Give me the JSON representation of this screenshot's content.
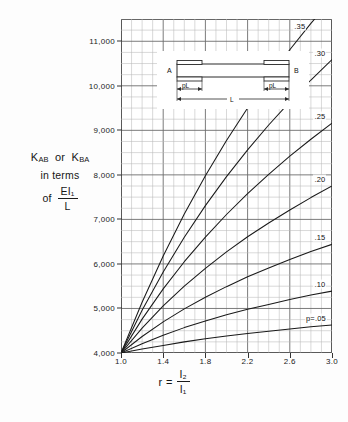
{
  "figure": {
    "y_axis_title": {
      "line1_k1": "K",
      "line1_k1_sub": "AB",
      "line1_or": "or",
      "line1_k2": "K",
      "line1_k2_sub": "BA",
      "line2": "in terms",
      "line3_of": "of",
      "line3_num": "EI₁",
      "line3_den": "L"
    },
    "x_axis_title": {
      "symbol": "r",
      "equals": "=",
      "num": "I₂",
      "den": "I₁"
    },
    "beam_diagram": {
      "left_support_label": "A",
      "right_support_label": "B",
      "left_dim_label": "pL",
      "right_dim_label": "pL",
      "span_label": "L"
    }
  },
  "chart_data": {
    "type": "line",
    "title": "",
    "xlabel": "r = I2/I1",
    "ylabel": "KAB or KBA in terms of EI1/L",
    "xlim": [
      1.0,
      3.0
    ],
    "ylim": [
      4000,
      11500
    ],
    "xticks": [
      1.0,
      1.4,
      1.8,
      2.2,
      2.6,
      3.0
    ],
    "xtick_labels": [
      "1.0",
      "1.4",
      "1.8",
      "2.2",
      "2.6",
      "3.0"
    ],
    "yticks": [
      4000,
      5000,
      6000,
      7000,
      8000,
      9000,
      10000,
      11000
    ],
    "ytick_labels": [
      "4,000",
      "5,000",
      "6,000",
      "7,000",
      "8,000",
      "9,000",
      "10,000",
      "11,000"
    ],
    "grid": true,
    "grid_minor_x_step": 0.1,
    "grid_minor_y_step": 250,
    "legend": "curve-end-labels",
    "legend_position": "right",
    "series": [
      {
        "name": ".35",
        "label": ".35",
        "p": 0.35,
        "x": [
          1.0,
          1.2,
          1.4,
          1.6,
          1.8,
          2.0,
          2.2,
          2.4,
          2.6,
          2.8,
          3.0
        ],
        "y": [
          4000,
          5140,
          6180,
          7120,
          7980,
          8770,
          9500,
          10180,
          10810,
          11400,
          11960
        ]
      },
      {
        "name": ".30",
        "label": ".30",
        "p": 0.3,
        "x": [
          1.0,
          1.2,
          1.4,
          1.6,
          1.8,
          2.0,
          2.2,
          2.4,
          2.6,
          2.8,
          3.0
        ],
        "y": [
          4000,
          4960,
          5820,
          6600,
          7310,
          7960,
          8560,
          9120,
          9640,
          10130,
          10590
        ]
      },
      {
        "name": ".25",
        "label": ".25",
        "p": 0.25,
        "x": [
          1.0,
          1.2,
          1.4,
          1.6,
          1.8,
          2.0,
          2.2,
          2.4,
          2.6,
          2.8,
          3.0
        ],
        "y": [
          4000,
          4760,
          5440,
          6050,
          6600,
          7110,
          7580,
          8010,
          8420,
          8800,
          9160
        ]
      },
      {
        "name": ".20",
        "label": ".20",
        "p": 0.2,
        "x": [
          1.0,
          1.2,
          1.4,
          1.6,
          1.8,
          2.0,
          2.2,
          2.4,
          2.6,
          2.8,
          3.0
        ],
        "y": [
          4000,
          4560,
          5060,
          5500,
          5900,
          6270,
          6610,
          6920,
          7210,
          7490,
          7750
        ]
      },
      {
        "name": ".15",
        "label": ".15",
        "p": 0.15,
        "x": [
          1.0,
          1.2,
          1.4,
          1.6,
          1.8,
          2.0,
          2.2,
          2.4,
          2.6,
          2.8,
          3.0
        ],
        "y": [
          4000,
          4370,
          4700,
          4990,
          5250,
          5490,
          5710,
          5910,
          6100,
          6280,
          6440
        ]
      },
      {
        "name": ".10",
        "label": ".10",
        "p": 0.1,
        "x": [
          1.0,
          1.2,
          1.4,
          1.6,
          1.8,
          2.0,
          2.2,
          2.4,
          2.6,
          2.8,
          3.0
        ],
        "y": [
          4000,
          4210,
          4400,
          4570,
          4720,
          4860,
          4980,
          5090,
          5200,
          5300,
          5390
        ]
      },
      {
        "name": "p=.05",
        "label": "p=.05",
        "p": 0.05,
        "x": [
          1.0,
          1.2,
          1.4,
          1.6,
          1.8,
          2.0,
          2.2,
          2.4,
          2.6,
          2.8,
          3.0
        ],
        "y": [
          4000,
          4090,
          4170,
          4250,
          4320,
          4380,
          4440,
          4490,
          4540,
          4590,
          4630
        ]
      }
    ]
  }
}
